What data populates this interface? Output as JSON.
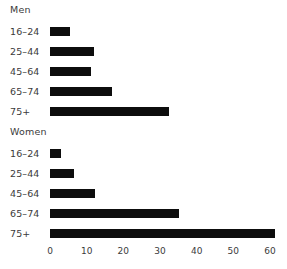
{
  "chart_data": {
    "type": "bar",
    "orientation": "horizontal",
    "title": "",
    "xlabel": "",
    "ylabel": "",
    "xlim": [
      0,
      60
    ],
    "grid": false,
    "legend": "none",
    "xticks": [
      0,
      10,
      20,
      30,
      40,
      50,
      60
    ],
    "xtick_labels": [
      "0",
      "10",
      "20",
      "30",
      "40",
      "50",
      "60"
    ],
    "groups": [
      {
        "name": "Men",
        "categories": [
          "16–24",
          "25–44",
          "45–64",
          "65–74",
          "75+"
        ],
        "values": [
          5.2,
          11.8,
          11.0,
          16.5,
          31.7
        ]
      },
      {
        "name": "Women",
        "categories": [
          "16–24",
          "25–44",
          "45–64",
          "65–74",
          "75+"
        ],
        "values": [
          3.0,
          6.3,
          12.1,
          34.4,
          60.0
        ]
      }
    ],
    "bar_color": "#0d0d0d",
    "background_color": "#ffffff"
  }
}
